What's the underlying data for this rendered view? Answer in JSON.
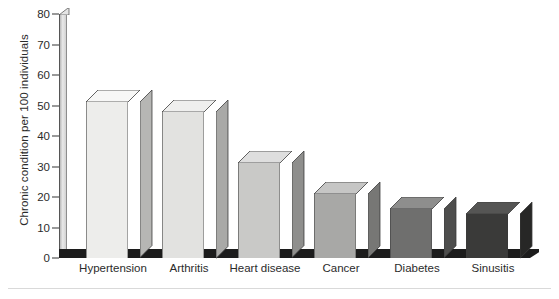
{
  "chart_data": {
    "type": "bar",
    "title": "",
    "subtitle": "",
    "xlabel": "",
    "ylabel": "Chronic condition per 100 individuals",
    "categories": [
      "Hypertension",
      "Arthritis",
      "Heart disease",
      "Cancer",
      "Diabetes",
      "Sinusitis"
    ],
    "values": [
      51,
      48,
      31,
      21,
      16,
      14.5
    ],
    "ylim": [
      0,
      80
    ],
    "yticks": [
      0,
      10,
      20,
      30,
      40,
      50,
      60,
      70,
      80
    ],
    "ytick_labels": [
      "0",
      "10",
      "20",
      "30",
      "40",
      "50",
      "60",
      "70",
      "80"
    ],
    "grid": false,
    "legend": false,
    "style_3d": true,
    "bar_colors": [
      "#ededeb",
      "#e2e2e0",
      "#c9c9c7",
      "#a8a8a6",
      "#6f6f6e",
      "#3a3a39"
    ],
    "bar_top_colors": [
      "#f7f7f6",
      "#efefee",
      "#dedede",
      "#c6c6c5",
      "#8e8e8d",
      "#555554"
    ],
    "bar_side_colors": [
      "#b6b6b4",
      "#a9a9a7",
      "#8f8f8d",
      "#777775",
      "#4e4e4d",
      "#272726"
    ],
    "baseline_color": "#1c1c1c",
    "axis_color": "#353535",
    "text_color": "#2b2b2b",
    "background_color": "#ffffff"
  },
  "axis": {
    "y_title": "Chronic condition per 100 individuals"
  }
}
